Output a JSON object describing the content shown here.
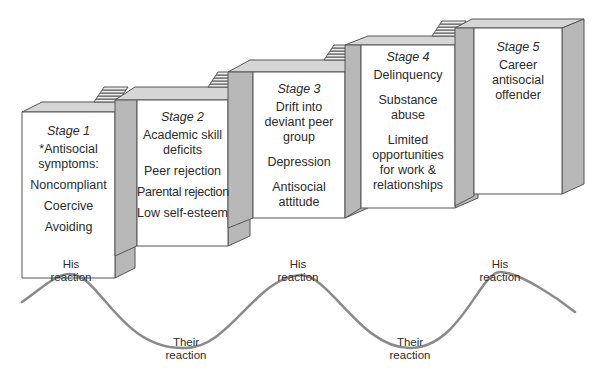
{
  "diagram": {
    "type": "staircase-with-wave",
    "colors": {
      "front_face": "#ffffff",
      "side_face": "#b8b8b8",
      "top_face": "#d6d6d6",
      "edge": "#555555",
      "wave": "#8a8a8a",
      "text": "#2b2b2b"
    }
  },
  "stages": [
    {
      "title": "Stage 1",
      "items": [
        "*Antisocial symptoms:",
        "Noncompliant",
        "Coercive",
        "Avoiding"
      ]
    },
    {
      "title": "Stage 2",
      "items": [
        "Academic skill deficits",
        "Peer rejection",
        "Parental rejection",
        "Low self-esteem"
      ]
    },
    {
      "title": "Stage 3",
      "items": [
        "Drift into deviant peer group",
        "Depression",
        "Antisocial attitude"
      ]
    },
    {
      "title": "Stage 4",
      "items": [
        "Delinquency",
        "Substance abuse",
        "Limited opportunities for work & relationships"
      ]
    },
    {
      "title": "Stage 5",
      "items": [
        "Career antisocial offender"
      ]
    }
  ],
  "wave": {
    "labels": [
      {
        "text": "His reaction",
        "position": "peak"
      },
      {
        "text": "Their reaction",
        "position": "trough"
      },
      {
        "text": "His reaction",
        "position": "peak"
      },
      {
        "text": "Their reaction",
        "position": "trough"
      },
      {
        "text": "His reaction",
        "position": "peak"
      }
    ]
  }
}
